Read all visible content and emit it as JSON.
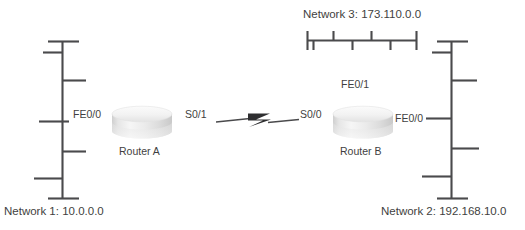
{
  "diagram": {
    "type": "network-topology",
    "background_color": "#ffffff",
    "line_color": "#4a4a4c",
    "text_color": "#3f3f41",
    "networks": [
      {
        "name": "network-1",
        "label": "Network 1: 10.0.0.0",
        "orientation": "vertical",
        "position": "left"
      },
      {
        "name": "network-2",
        "label": "Network 2: 192.168.10.0",
        "orientation": "vertical",
        "position": "right"
      },
      {
        "name": "network-3",
        "label": "Network 3: 173.110.0.0",
        "orientation": "horizontal",
        "position": "top"
      }
    ],
    "routers": [
      {
        "name": "router-a",
        "label": "Router A",
        "interfaces": [
          {
            "name": "fe0-0-a",
            "label": "FE0/0",
            "side": "left"
          },
          {
            "name": "s0-1-a",
            "label": "S0/1",
            "side": "right"
          }
        ]
      },
      {
        "name": "router-b",
        "label": "Router B",
        "interfaces": [
          {
            "name": "s0-0-b",
            "label": "S0/0",
            "side": "left"
          },
          {
            "name": "fe0-0-b",
            "label": "FE0/0",
            "side": "right"
          },
          {
            "name": "fe0-1-b",
            "label": "FE0/1",
            "side": "top"
          }
        ]
      }
    ],
    "links": [
      {
        "name": "serial-link",
        "from": "S0/1",
        "to": "S0/0",
        "style": "lightning-bolt"
      }
    ]
  }
}
